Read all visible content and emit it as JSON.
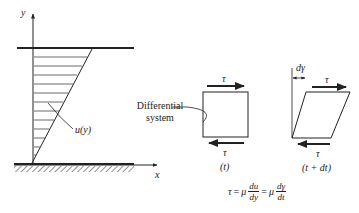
{
  "diagram": {
    "axes": {
      "x_label": "x",
      "y_label": "y"
    },
    "velocity_profile_label": "u(y)",
    "differential_label_line1": "Differential",
    "differential_label_line2": "system",
    "element_at_t": {
      "tau_top": "τ",
      "tau_bottom": "τ",
      "time_label": "(t)"
    },
    "element_at_t_dt": {
      "angle_label": "dγ",
      "tau_top": "τ",
      "tau_bottom": "τ",
      "time_label": "(t + dt)"
    },
    "equation": {
      "lhs": "τ",
      "eq1": "=",
      "mu1": "μ",
      "frac1_num": "du",
      "frac1_den": "dy",
      "eq2": "=",
      "mu2": "μ",
      "frac2_num": "dγ",
      "frac2_den": "dt"
    },
    "colors": {
      "ink": "#222222",
      "background": "#ffffff"
    }
  }
}
